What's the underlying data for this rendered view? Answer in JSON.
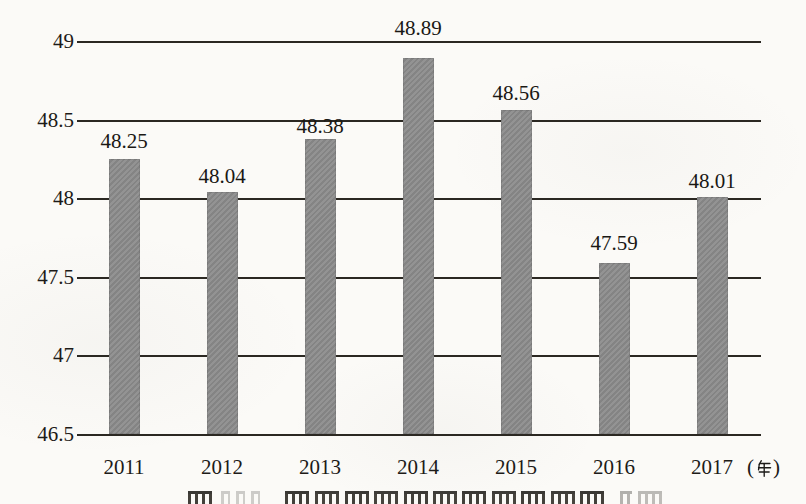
{
  "chart_data": {
    "type": "bar",
    "title": "",
    "categories": [
      "2011",
      "2012",
      "2013",
      "2014",
      "2015",
      "2016",
      "2017"
    ],
    "values": [
      48.25,
      48.04,
      48.38,
      48.89,
      48.56,
      47.59,
      48.01
    ],
    "data_labels": [
      "48.25",
      "48.04",
      "48.38",
      "48.89",
      "48.56",
      "47.59",
      "48.01"
    ],
    "xlabel": "",
    "ylabel": "",
    "x_axis_unit": "（年）",
    "unit_open": "(",
    "unit_char": "年",
    "unit_close": ")",
    "ylim": [
      46.5,
      49
    ],
    "y_tick_step": 0.5,
    "y_ticks": [
      49,
      48.5,
      48,
      47.5,
      47,
      46.5
    ],
    "y_tick_labels": [
      "49",
      "48.5",
      "48",
      "47.5",
      "47",
      "46.5"
    ],
    "grid": "horizontal-only",
    "legend": "none",
    "bar_color": "#8b8b8b",
    "gridline_color": "#2b2822",
    "text_color": "#1d1b18",
    "background_color": "#fbfaf7"
  }
}
